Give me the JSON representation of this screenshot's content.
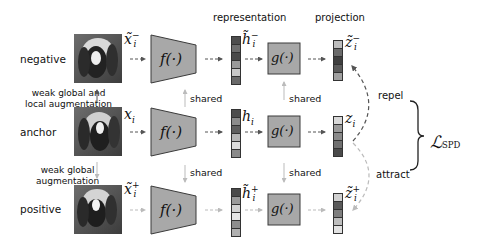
{
  "headers": {
    "representation": "representation",
    "projection": "projection"
  },
  "rows": [
    {
      "id": "negative",
      "label": "negative",
      "input_symbol": "x̃",
      "input_sup": "−",
      "input_sub": "i",
      "encoder": "f(·)",
      "rep_symbol": "h̃",
      "rep_sup": "−",
      "rep_sub": "i",
      "rep_colors": [
        "#4d4d4d",
        "#6e6e6e",
        "#4a4a4a",
        "#9a9a9a",
        "#c8c8c8",
        "#6a6a6a"
      ],
      "projector": "g(·)",
      "proj_symbol": "z̃",
      "proj_sup": "−",
      "proj_sub": "i",
      "proj_colors": [
        "#bdbdbd",
        "#6b6b6b",
        "#3f3f3f",
        "#5a5a5a",
        "#a0a0a0"
      ]
    },
    {
      "id": "anchor",
      "label": "anchor",
      "input_symbol": "x",
      "input_sup": "",
      "input_sub": "i",
      "encoder": "f(·)",
      "rep_symbol": "h",
      "rep_sup": "",
      "rep_sub": "i",
      "rep_colors": [
        "#4d4d4d",
        "#8c8c8c",
        "#5e5e5e",
        "#b5b5b5",
        "#dcdcdc",
        "#8a8a8a"
      ],
      "projector": "g(·)",
      "proj_symbol": "z",
      "proj_sup": "",
      "proj_sub": "i",
      "proj_colors": [
        "#d8d8d8",
        "#9a9a9a",
        "#8a8a8a",
        "#707070",
        "#4a4a4a"
      ]
    },
    {
      "id": "positive",
      "label": "positive",
      "input_symbol": "x̃",
      "input_sup": "+",
      "input_sub": "i",
      "encoder": "f(·)",
      "rep_symbol": "h̃",
      "rep_sup": "+",
      "rep_sub": "i",
      "rep_colors": [
        "#4a4a4a",
        "#9a9a9a",
        "#d2d2d2",
        "#e6e6e6",
        "#8e8e8e",
        "#b0b0b0"
      ],
      "projector": "g(·)",
      "proj_symbol": "z̃",
      "proj_sup": "+",
      "proj_sub": "i",
      "proj_colors": [
        "#d0d0d0",
        "#5a5a5a",
        "#7e7e7e",
        "#bdbdbd",
        "#e2e2e2"
      ]
    }
  ],
  "augmentations": {
    "neg": [
      "weak global and",
      "local augmentation"
    ],
    "pos": [
      "weak global",
      "augmentation"
    ]
  },
  "shared_label": "shared",
  "relations": {
    "repel": "repel",
    "attract": "attract"
  },
  "loss": {
    "symbol": "ℒ",
    "subscript": "SPD"
  },
  "colors": {
    "block_fill": "#a8a8a8",
    "block_stroke": "#3a3a3a",
    "arrow_dark": "#555555",
    "arrow_light": "#b8b8b8"
  }
}
